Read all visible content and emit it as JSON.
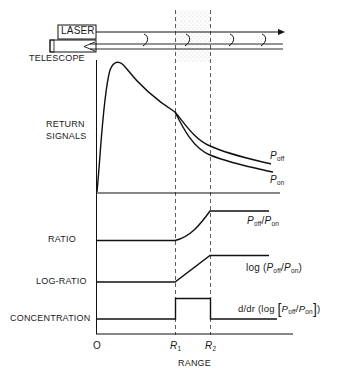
{
  "diagram": {
    "apparatus": {
      "laser_label": "LASER",
      "telescope_label": "TELESCOPE"
    },
    "panels": [
      {
        "label_line1": "RETURN",
        "label_line2": "SIGNALS",
        "curves": [
          "P_off",
          "P_on"
        ]
      },
      {
        "label": "RATIO",
        "curve": "P_off/P_on"
      },
      {
        "label": "LOG-RATIO",
        "curve": "log (P_off/P_on)"
      },
      {
        "label": "CONCENTRATION",
        "curve": "d/dr (log [P_off/P_on])"
      }
    ],
    "curve_labels": {
      "p_off": {
        "base": "P",
        "sub": "off"
      },
      "p_on": {
        "base": "P",
        "sub": "on"
      },
      "ratio": {
        "pre": "",
        "base1": "P",
        "sub1": "off",
        "sep": "/",
        "base2": "P",
        "sub2": "on",
        "post": ""
      },
      "log_ratio": {
        "pre": "log (",
        "base1": "P",
        "sub1": "off",
        "sep": "/",
        "base2": "P",
        "sub2": "on",
        "post": ")"
      },
      "concentration": {
        "pre": "d/dr (log ",
        "lb": "[",
        "base1": "P",
        "sub1": "off",
        "sep": "/",
        "base2": "P",
        "sub2": "on",
        "rb": "]",
        "post": ")"
      }
    },
    "x_axis": {
      "title": "RANGE",
      "ticks": [
        {
          "label": "O",
          "sub": ""
        },
        {
          "label": "R",
          "sub": "1"
        },
        {
          "label": "R",
          "sub": "2"
        }
      ]
    },
    "colors": {
      "line": "#111111",
      "stipple": "#9a9a9a"
    }
  }
}
